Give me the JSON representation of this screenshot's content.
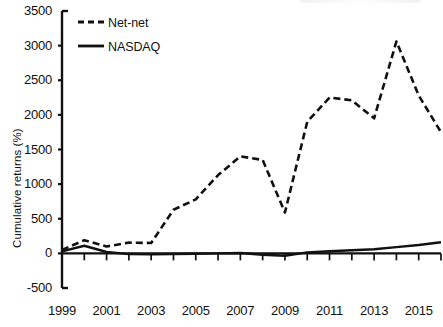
{
  "chart_data": {
    "type": "line",
    "title": "",
    "xlabel": "",
    "ylabel": "Cumulative returns (%)",
    "ylim": [
      -500,
      3500
    ],
    "ytick_values": [
      3500,
      3000,
      2500,
      2000,
      1500,
      1000,
      500,
      0,
      -500
    ],
    "ytick_labels": [
      "3500",
      "3000",
      "2500",
      "2000",
      "1500",
      "1000",
      "500",
      "0",
      "-500"
    ],
    "xlim": [
      1999,
      2016
    ],
    "xtick_labels": [
      "1999",
      "2001",
      "2003",
      "2005",
      "2007",
      "2009",
      "2011",
      "2013",
      "2015"
    ],
    "xtick_values": [
      1999,
      2001,
      2003,
      2005,
      2007,
      2009,
      2011,
      2013,
      2015
    ],
    "x": [
      1999,
      2000,
      2001,
      2002,
      2003,
      2004,
      2005,
      2006,
      2007,
      2008,
      2009,
      2010,
      2011,
      2012,
      2013,
      2014,
      2015,
      2016
    ],
    "grid": false,
    "legend_position": "upper-left",
    "series": [
      {
        "name": "Net-net",
        "style": "dashed",
        "color": "#111111",
        "values": [
          50,
          190,
          100,
          155,
          150,
          630,
          780,
          1130,
          1400,
          1350,
          590,
          1900,
          2250,
          2210,
          1950,
          3060,
          2280,
          1750
        ]
      },
      {
        "name": "NASDAQ",
        "style": "solid",
        "color": "#111111",
        "values": [
          30,
          110,
          20,
          -10,
          -15,
          -10,
          -5,
          0,
          5,
          -20,
          -35,
          15,
          30,
          45,
          60,
          90,
          120,
          160
        ]
      }
    ]
  },
  "legend": {
    "items": [
      {
        "label": "Net-net",
        "style": "dashed"
      },
      {
        "label": "NASDAQ",
        "style": "solid"
      }
    ]
  },
  "axes": {
    "y_axis_title": "Cumulative returns (%)"
  }
}
